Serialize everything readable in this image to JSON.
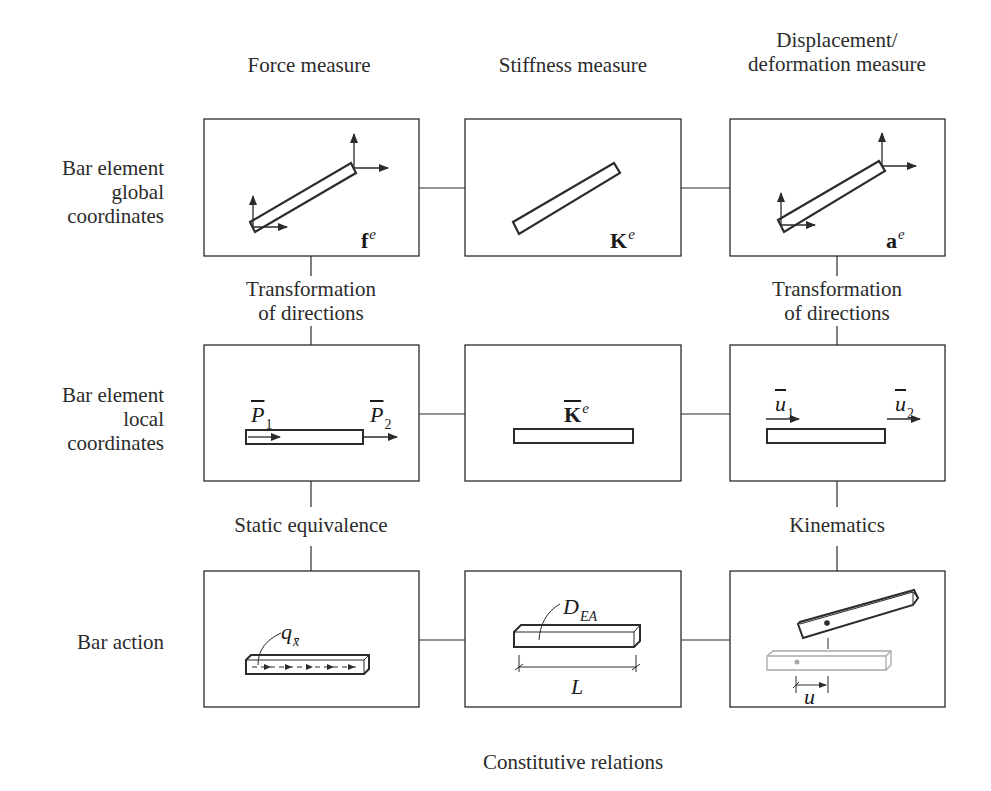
{
  "columns": {
    "force": "Force measure",
    "stiffness": "Stiffness measure",
    "displacement_line1": "Displacement/",
    "displacement_line2": "deformation measure"
  },
  "rows": {
    "global_line1": "Bar element",
    "global_line2": "global",
    "global_line3": "coordinates",
    "local_line1": "Bar element",
    "local_line2": "local",
    "local_line3": "coordinates",
    "action": "Bar action"
  },
  "transitions": {
    "force_top_line1": "Transformation",
    "force_top_line2": "of directions",
    "disp_top_line1": "Transformation",
    "disp_top_line2": "of directions",
    "force_bottom": "Static equivalence",
    "disp_bottom": "Kinematics",
    "bottom_caption": "Constitutive relations"
  },
  "symbols": {
    "global_force": {
      "base": "f",
      "sup": "e"
    },
    "global_stiffness": {
      "base": "K",
      "sup": "e"
    },
    "global_disp": {
      "base": "a",
      "sup": "e"
    },
    "local_force_1": {
      "base": "P",
      "sub": "1"
    },
    "local_force_2": {
      "base": "P",
      "sub": "2"
    },
    "local_stiffness": {
      "base": "K",
      "sup": "e"
    },
    "local_disp_1": {
      "base": "u",
      "sub": "1"
    },
    "local_disp_2": {
      "base": "u",
      "sub": "2"
    },
    "action_load": {
      "base": "q",
      "sub": "x̄"
    },
    "action_stiffness": {
      "base": "D",
      "sub": "EA"
    },
    "action_length": "L",
    "action_disp": "u"
  },
  "colors": {
    "stroke": "#2b2b2b",
    "ghost": "#a8a8a8",
    "background": "#ffffff"
  }
}
